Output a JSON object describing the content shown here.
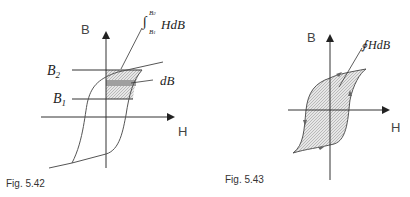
{
  "figures": [
    {
      "caption": "Fig. 5.42",
      "axis_y_label": "B",
      "axis_x_label": "H",
      "level_labels": [
        "B",
        "B"
      ],
      "level_subscripts": [
        "2",
        "1"
      ],
      "annotation_integral": "HdB",
      "annotation_int_upper": "B",
      "annotation_int_upper_sub": "2",
      "annotation_int_lower": "B",
      "annotation_int_lower_sub": "1",
      "annotation_strip": "dB"
    },
    {
      "caption": "Fig. 5.43",
      "axis_y_label": "B",
      "axis_x_label": "H",
      "annotation_loop_integral": "HdB",
      "annotation_loop_symbol": "∮"
    }
  ]
}
